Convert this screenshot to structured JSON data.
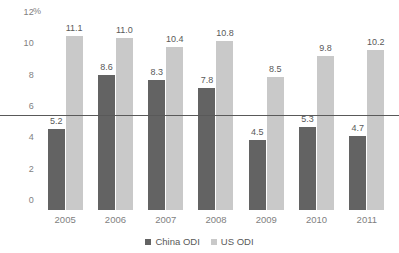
{
  "chart_data": {
    "type": "bar",
    "title": "",
    "xlabel": "",
    "ylabel": "%",
    "unit_label": "%",
    "categories": [
      "2005",
      "2006",
      "2007",
      "2008",
      "2009",
      "2010",
      "2011"
    ],
    "series": [
      {
        "name": "China ODI",
        "color": "#636363",
        "values": [
          5.2,
          8.6,
          8.3,
          7.8,
          4.5,
          5.3,
          4.7
        ],
        "labels": [
          "5.2",
          "8.6",
          "8.3",
          "7.8",
          "4.5",
          "5.3",
          "4.7"
        ]
      },
      {
        "name": "US ODI",
        "color": "#c9c9c9",
        "values": [
          11.1,
          11.0,
          10.4,
          10.8,
          8.5,
          9.8,
          10.2
        ],
        "labels": [
          "11.1",
          "11.0",
          "10.4",
          "10.8",
          "8.5",
          "9.8",
          "10.2"
        ]
      }
    ],
    "ylim": [
      0,
      12
    ],
    "yticks": [
      0,
      2,
      4,
      6,
      8,
      10,
      12
    ],
    "ytick_labels": [
      "0",
      "2",
      "4",
      "6",
      "8",
      "10",
      "12"
    ],
    "grid": false,
    "legend_position": "bottom-center",
    "reference_line": {
      "value": 6,
      "color": "#595959"
    },
    "data_labels_shown": true
  },
  "colors": {
    "background": "#ffffff",
    "axis_text": "#7f7f7f",
    "label_text": "#595959",
    "china_odi": "#636363",
    "us_odi": "#c9c9c9",
    "reference_line": "#595959"
  }
}
